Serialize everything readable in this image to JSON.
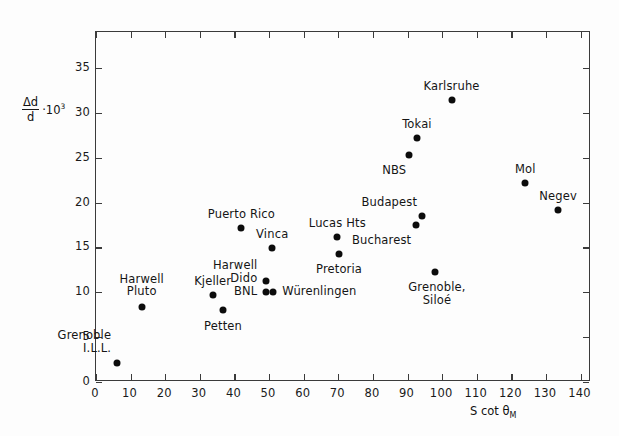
{
  "chart_data": {
    "type": "scatter",
    "title": "",
    "xlabel": "S cot θM",
    "ylabel": "Δd/d · 10³",
    "xlim": [
      0,
      143
    ],
    "ylim": [
      0,
      39
    ],
    "grid": false,
    "legend": "none",
    "xticks": [
      0,
      10,
      20,
      30,
      40,
      50,
      60,
      70,
      80,
      90,
      100,
      110,
      120,
      130,
      140
    ],
    "yticks": [
      0,
      5,
      10,
      15,
      20,
      25,
      30,
      35
    ],
    "points": [
      {
        "label": "Grenoble\nI.L.L.",
        "x": 6.4,
        "y": 2.0,
        "label_pos": "above-left",
        "label_dx": -6,
        "label_dy": -34
      },
      {
        "label": "Harwell\nPluto",
        "x": 13.5,
        "y": 8.3,
        "label_pos": "above",
        "label_dx": 0,
        "label_dy": -34
      },
      {
        "label": "Kjeller",
        "x": 34.0,
        "y": 9.6,
        "label_pos": "above",
        "label_dx": 0,
        "label_dy": -20
      },
      {
        "label": "Petten",
        "x": 37.0,
        "y": 7.9,
        "label_pos": "below",
        "label_dx": 0,
        "label_dy": 10
      },
      {
        "label": "Puerto Rico",
        "x": 42.3,
        "y": 17.0,
        "label_pos": "above",
        "label_dx": 0,
        "label_dy": -20
      },
      {
        "label": "Vinca",
        "x": 51.2,
        "y": 14.8,
        "label_pos": "above",
        "label_dx": 0,
        "label_dy": -20
      },
      {
        "label": "Harwell\nDido",
        "x": 49.5,
        "y": 11.1,
        "label_pos": "left",
        "label_dx": -9,
        "label_dy": -22
      },
      {
        "label": "BNL",
        "x": 49.5,
        "y": 9.9,
        "label_pos": "left",
        "label_dx": -9,
        "label_dy": -7
      },
      {
        "label": "Würenlingen",
        "x": 51.5,
        "y": 9.9,
        "label_pos": "right",
        "label_dx": 9,
        "label_dy": -7
      },
      {
        "label": "Lucas Hts",
        "x": 70.0,
        "y": 16.1,
        "label_pos": "above",
        "label_dx": 0,
        "label_dy": -20
      },
      {
        "label": "Pretoria",
        "x": 70.5,
        "y": 14.2,
        "label_pos": "below",
        "label_dx": 0,
        "label_dy": 9
      },
      {
        "label": "NBS",
        "x": 90.8,
        "y": 25.2,
        "label_pos": "below-left",
        "label_dx": -3,
        "label_dy": 9
      },
      {
        "label": "Tokai",
        "x": 93.0,
        "y": 27.1,
        "label_pos": "above",
        "label_dx": 0,
        "label_dy": -20
      },
      {
        "label": "Karlsruhe",
        "x": 103.0,
        "y": 31.3,
        "label_pos": "above",
        "label_dx": 0,
        "label_dy": -20
      },
      {
        "label": "Budapest",
        "x": 94.5,
        "y": 18.4,
        "label_pos": "above-left",
        "label_dx": -5,
        "label_dy": -20
      },
      {
        "label": "Bucharest",
        "x": 92.8,
        "y": 17.4,
        "label_pos": "below-left",
        "label_dx": -5,
        "label_dy": 9
      },
      {
        "label": "Grenoble,\nSiloé",
        "x": 98.2,
        "y": 12.1,
        "label_pos": "below",
        "label_dx": 2,
        "label_dy": 9
      },
      {
        "label": "Mol",
        "x": 124.3,
        "y": 22.1,
        "label_pos": "above",
        "label_dx": 0,
        "label_dy": -20
      },
      {
        "label": "Negev",
        "x": 133.8,
        "y": 19.1,
        "label_pos": "above",
        "label_dx": 0,
        "label_dy": -20
      }
    ]
  },
  "axes": {
    "y_label_numerator": "Δd",
    "y_label_denominator": "d",
    "y_label_multiplier": "·10",
    "y_label_exponent": "3",
    "x_label_main": "S cot θ",
    "x_label_sub": "M"
  }
}
